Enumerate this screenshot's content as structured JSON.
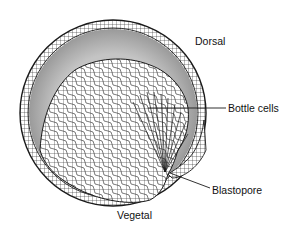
{
  "figure": {
    "labels": {
      "dorsal": "Dorsal",
      "bottle_cells": "Bottle cells",
      "blastopore": "Blastopore",
      "vegetal": "Vegetal"
    },
    "colors": {
      "background": "#ffffff",
      "outline": "#1a1a1a",
      "blastocoel_fill": "#b5b5b5",
      "cell_fill": "#ffffff"
    }
  }
}
